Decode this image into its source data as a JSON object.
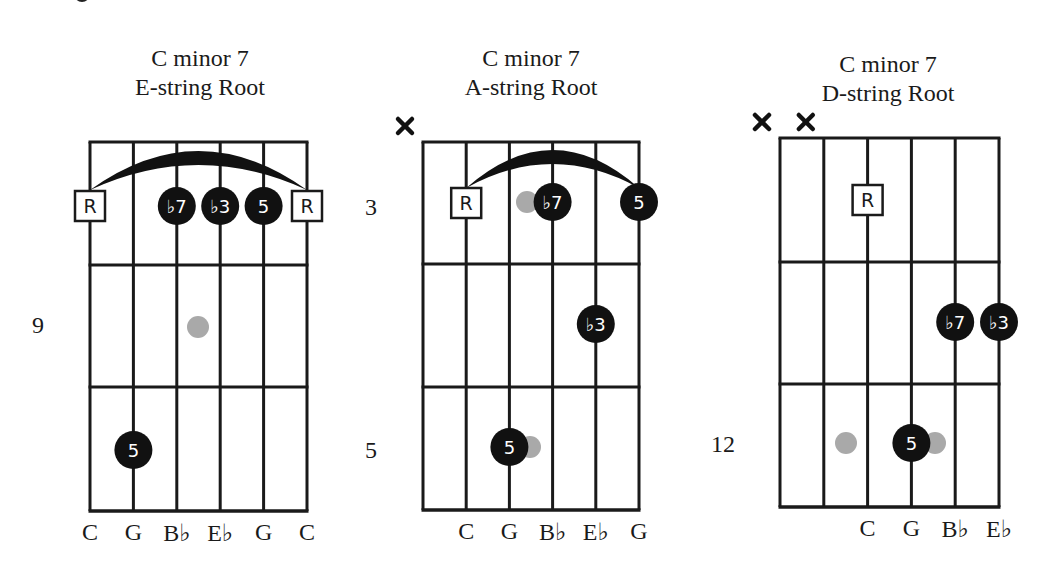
{
  "colors": {
    "line": "#1a1a1a",
    "filled_dot": "#111111",
    "ghost_dot": "#a9a9a9",
    "dot_text": "#ffffff",
    "root_box_fill": "#ffffff"
  },
  "diagrams": [
    {
      "title_line1": "C minor 7",
      "title_line2": "E-string Root",
      "title_pos": {
        "x": 80,
        "y": 44
      },
      "grid": {
        "x0": 90,
        "y0": 142,
        "string_gap": 43.4,
        "frets_y": [
          142,
          265,
          387,
          511
        ]
      },
      "fret_labels": [
        {
          "text": "9",
          "x": 32,
          "y": 312
        }
      ],
      "muted": [],
      "barre": {
        "from_string": 0,
        "to_string": 5,
        "y_end": 190
      },
      "markers": [
        {
          "type": "root",
          "label": "R",
          "string": 0,
          "y": 206
        },
        {
          "type": "filled",
          "label": "♭7",
          "string": 2,
          "y": 206
        },
        {
          "type": "filled",
          "label": "♭3",
          "string": 3,
          "y": 206
        },
        {
          "type": "filled",
          "label": "5",
          "string": 4,
          "y": 206
        },
        {
          "type": "root",
          "label": "R",
          "string": 5,
          "y": 206
        },
        {
          "type": "ghost",
          "label": "",
          "x": 198,
          "y": 327
        },
        {
          "type": "filled",
          "label": "5",
          "string": 1,
          "y": 450
        }
      ],
      "string_labels": [
        {
          "text": "C",
          "string": 0
        },
        {
          "text": "G",
          "string": 1
        },
        {
          "text": "B♭",
          "string": 2
        },
        {
          "text": "E♭",
          "string": 3
        },
        {
          "text": "G",
          "string": 4
        },
        {
          "text": "C",
          "string": 5
        }
      ]
    },
    {
      "title_line1": "C minor 7",
      "title_line2": "A-string Root",
      "title_pos": {
        "x": 411,
        "y": 44
      },
      "grid": {
        "x0": 423,
        "y0": 142,
        "string_gap": 43.2,
        "frets_y": [
          142,
          264,
          387,
          510
        ]
      },
      "fret_labels": [
        {
          "text": "3",
          "x": 365,
          "y": 194
        },
        {
          "text": "5",
          "x": 365,
          "y": 437
        }
      ],
      "muted": [
        0
      ],
      "barre": {
        "from_string": 1,
        "to_string": 5,
        "y_end": 188
      },
      "markers": [
        {
          "type": "root",
          "label": "R",
          "string": 1,
          "y": 203
        },
        {
          "type": "ghost",
          "label": "",
          "x": 527,
          "y": 202
        },
        {
          "type": "filled",
          "label": "♭7",
          "string": 3,
          "y": 202
        },
        {
          "type": "filled",
          "label": "5",
          "string": 5,
          "y": 202
        },
        {
          "type": "filled",
          "label": "♭3",
          "string": 4,
          "y": 324
        },
        {
          "type": "ghost",
          "label": "",
          "x": 530,
          "y": 447
        },
        {
          "type": "filled",
          "label": "5",
          "string": 2,
          "y": 447
        }
      ],
      "string_labels": [
        {
          "text": "C",
          "string": 1
        },
        {
          "text": "G",
          "string": 2
        },
        {
          "text": "B♭",
          "string": 3
        },
        {
          "text": "E♭",
          "string": 4
        },
        {
          "text": "G",
          "string": 5
        }
      ]
    },
    {
      "title_line1": "C minor 7",
      "title_line2": "D-string Root",
      "title_pos": {
        "x": 768,
        "y": 50
      },
      "grid": {
        "x0": 780,
        "y0": 138,
        "string_gap": 43.8,
        "frets_y": [
          138,
          262,
          384,
          507
        ]
      },
      "fret_labels": [
        {
          "text": "12",
          "x": 711,
          "y": 431
        }
      ],
      "muted": [
        0,
        1
      ],
      "barre": null,
      "markers": [
        {
          "type": "root",
          "label": "R",
          "string": 2,
          "y": 200
        },
        {
          "type": "filled",
          "label": "♭7",
          "string": 4,
          "y": 322
        },
        {
          "type": "filled",
          "label": "♭3",
          "string": 5,
          "y": 322
        },
        {
          "type": "ghost",
          "label": "",
          "x": 846,
          "y": 443
        },
        {
          "type": "ghost",
          "label": "",
          "x": 935,
          "y": 443
        },
        {
          "type": "filled",
          "label": "5",
          "string": 3,
          "y": 443
        }
      ],
      "string_labels": [
        {
          "text": "C",
          "string": 2
        },
        {
          "text": "G",
          "string": 3
        },
        {
          "text": "B♭",
          "string": 4
        },
        {
          "text": "E♭",
          "string": 5
        }
      ]
    }
  ]
}
